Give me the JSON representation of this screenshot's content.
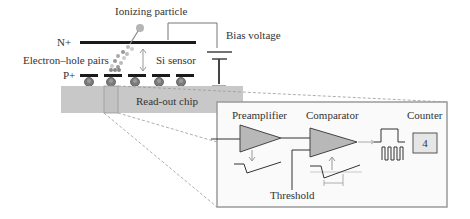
{
  "diagram": {
    "labels": {
      "ionizing_particle": "Ionizing particle",
      "n_plus": "N+",
      "p_plus": "P+",
      "bias_voltage": "Bias voltage",
      "electron_hole_pairs": "Electron–hole pairs",
      "si_sensor": "Si sensor",
      "readout_chip": "Read-out chip",
      "preamplifier": "Preamplifier",
      "comparator": "Comparator",
      "counter": "Counter",
      "threshold": "Threshold"
    },
    "counter_value": "4",
    "colors": {
      "chip_fill": "#c8c8c8",
      "amp_fill": "#b8b8b8",
      "inset_border": "#9a9a9a",
      "electrode": "#1a1a1a",
      "bump": "#777777",
      "particle": "#b0b0b0"
    }
  }
}
